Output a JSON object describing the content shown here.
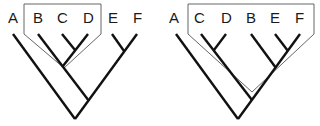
{
  "figure": {
    "trees": [
      {
        "id": "tree-left",
        "taxa": [
          "A",
          "B",
          "C",
          "D",
          "E",
          "F"
        ],
        "topology": "(A,((B,(C,D)),(E,F)))",
        "highlighted_group": [
          "B",
          "C",
          "D"
        ],
        "group_type": "monophyletic"
      },
      {
        "id": "tree-right",
        "taxa": [
          "A",
          "C",
          "D",
          "B",
          "E",
          "F"
        ],
        "topology": "(A,((C,D),(B,(E,F))))",
        "highlighted_group": [
          "C",
          "D",
          "B",
          "E",
          "F"
        ],
        "group_type": "monophyletic"
      }
    ]
  },
  "labels": {
    "left": [
      "A",
      "B",
      "C",
      "D",
      "E",
      "F"
    ],
    "right": [
      "A",
      "C",
      "D",
      "B",
      "E",
      "F"
    ]
  },
  "colors": {
    "branch": "#111111",
    "clade_outline": "#555555",
    "background": "#ffffff"
  }
}
